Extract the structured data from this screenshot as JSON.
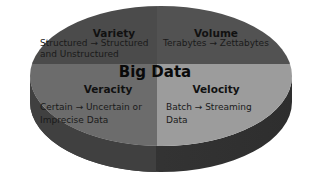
{
  "diagram": {
    "title": "Big Data",
    "segments": [
      {
        "id": "variety",
        "title": "Variety",
        "description_line1": "Structured → Structured",
        "description_line2": "and Unstructured",
        "color": "#4b4b4b"
      },
      {
        "id": "volume",
        "title": "Volume",
        "description_line1": "Terabytes → Zettabytes",
        "color": "#525252"
      },
      {
        "id": "veracity",
        "title": "Veracity",
        "description_line1": "Certain → Uncertain or",
        "description_line2": "Imprecise Data",
        "color": "#6c6c6c"
      },
      {
        "id": "velocity",
        "title": "Velocity",
        "description_line1": "Batch → Streaming",
        "description_line2": "Data",
        "color": "#9c9c9c"
      }
    ],
    "side_color": "#393939",
    "side_color_light": "#444444"
  }
}
